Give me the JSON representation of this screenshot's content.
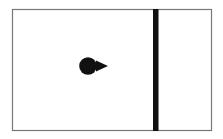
{
  "canvas": {
    "width": 223,
    "height": 139,
    "background": "#ffffff"
  },
  "diagram": {
    "frame": {
      "x": 12.5,
      "y": 9.5,
      "width": 199,
      "height": 121,
      "stroke": "#777777",
      "stroke_width": 1.2
    },
    "wall": {
      "x": 153,
      "y": 9,
      "width": 5.5,
      "height": 122,
      "fill": "#111111"
    },
    "agent": {
      "body": {
        "cx": 88,
        "cy": 66,
        "r": 8.8,
        "fill": "#111111"
      },
      "heading": {
        "points": "96,60.5 108,66 96,71.5",
        "fill": "#111111",
        "direction": "right"
      }
    }
  }
}
